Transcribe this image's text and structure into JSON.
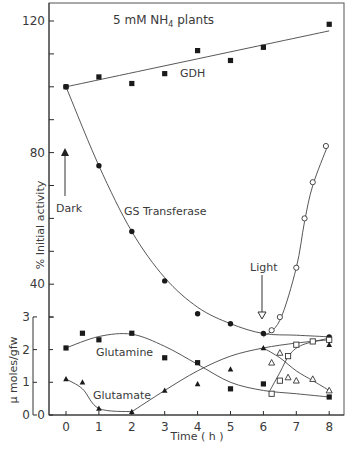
{
  "figure": {
    "title": "5 mM NH4 plants",
    "title_main": "5 mM NH",
    "title_sub": "4",
    "title_tail": " plants",
    "xlabel": "Time ( h )",
    "ylabel_top": "% Initial activity",
    "ylabel_bottom": "μ moles/gfw",
    "annotations": {
      "dark": "Dark",
      "light": "Light",
      "gdh": "GDH",
      "gs": "GS Transferase",
      "glutamine": "Glutamine",
      "glutamate": "Glutamate"
    },
    "x_ticks": [
      "0",
      "1",
      "2",
      "3",
      "4",
      "5",
      "6",
      "7",
      "8"
    ],
    "y_top_ticks": [
      "40",
      "80",
      "120"
    ],
    "y_bottom_ticks": [
      "0",
      "1",
      "2",
      "3"
    ],
    "y_bottom_inner_zero": "0",
    "colors": {
      "ink": "#2b2b2b",
      "background": "#ffffff"
    }
  },
  "chart_data": [
    {
      "type": "line",
      "title": "5 mM NH4 plants",
      "panel": "upper",
      "xlabel": "Time (h)",
      "ylabel": "% Initial activity",
      "xlim": [
        0,
        8
      ],
      "ylim": [
        20,
        122
      ],
      "y_ticks_labeled": [
        40,
        80,
        120
      ],
      "grid": false,
      "series": [
        {
          "name": "GDH",
          "marker": "filled-square",
          "x": [
            0,
            1,
            2,
            3,
            4,
            5,
            6,
            8
          ],
          "y": [
            100,
            103,
            101,
            104,
            111,
            108,
            112,
            119
          ]
        },
        {
          "name": "GS Transferase (dark)",
          "marker": "filled-circle",
          "x": [
            0,
            1,
            2,
            3,
            4,
            5,
            6,
            8
          ],
          "y": [
            100,
            76,
            56,
            41,
            31,
            28,
            25,
            24
          ]
        },
        {
          "name": "GS Transferase (light)",
          "marker": "open-circle",
          "x": [
            6.25,
            6.5,
            7,
            7.25,
            7.5,
            7.9
          ],
          "y": [
            26,
            30,
            45,
            60,
            71,
            82
          ]
        }
      ],
      "annotations": [
        "Dark (arrow at t=0)",
        "Light (arrow at t=6)"
      ]
    },
    {
      "type": "line",
      "panel": "lower",
      "xlabel": "Time (h)",
      "ylabel": "μ moles/gfw",
      "xlim": [
        0,
        8
      ],
      "ylim": [
        0,
        3
      ],
      "x_ticks": [
        0,
        1,
        2,
        3,
        4,
        5,
        6,
        7,
        8
      ],
      "y_ticks": [
        0,
        1,
        2,
        3
      ],
      "grid": false,
      "series": [
        {
          "name": "Glutamine (dark)",
          "marker": "filled-square",
          "x": [
            0,
            0.5,
            1,
            2,
            3,
            4,
            5,
            6,
            8
          ],
          "y": [
            2.05,
            2.5,
            2.3,
            2.5,
            1.75,
            1.6,
            0.8,
            0.95,
            0.55
          ]
        },
        {
          "name": "Glutamine (light)",
          "marker": "open-square",
          "x": [
            6.25,
            6.5,
            6.75,
            7,
            7.5,
            8
          ],
          "y": [
            0.65,
            1.05,
            1.8,
            2.15,
            2.25,
            2.3
          ]
        },
        {
          "name": "Glutamate (dark)",
          "marker": "filled-triangle",
          "x": [
            0,
            0.5,
            1,
            2,
            3,
            4,
            5,
            6,
            8
          ],
          "y": [
            1.1,
            1.0,
            0.2,
            0.1,
            0.75,
            0.95,
            1.4,
            2.05,
            2.15
          ]
        },
        {
          "name": "Glutamate (light)",
          "marker": "open-triangle",
          "x": [
            6.25,
            6.5,
            6.75,
            7,
            7.5,
            8
          ],
          "y": [
            1.6,
            1.9,
            1.15,
            1.05,
            1.1,
            0.75
          ]
        }
      ]
    }
  ]
}
